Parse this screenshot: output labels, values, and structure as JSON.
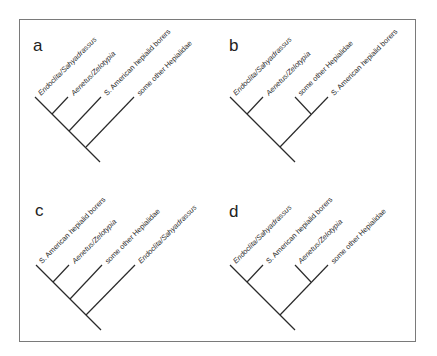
{
  "figure": {
    "type": "cladogram-comparison",
    "panels": [
      {
        "letter": "a",
        "taxa": [
          {
            "label": "Endoclita/Sahyadrassus",
            "italic": true
          },
          {
            "label": "Aenetus/Zelotypia",
            "italic": true
          },
          {
            "label": "S. American hepialid borers",
            "italic": false
          },
          {
            "label": "some other Hepialidae",
            "italic": false
          }
        ],
        "topology": "(((Endoclita/Sahyadrassus, Aenetus/Zelotypia), S. American hepialid borers), some other Hepialidae)"
      },
      {
        "letter": "b",
        "taxa": [
          {
            "label": "Endoclita/Sahyadrassus",
            "italic": true
          },
          {
            "label": "Aenetus/Zelotypia",
            "italic": true
          },
          {
            "label": "some other Hepialidae",
            "italic": false
          },
          {
            "label": "S. American hepialid borers",
            "italic": false
          }
        ],
        "topology": "((Endoclita/Sahyadrassus, Aenetus/Zelotypia), (some other Hepialidae, S. American hepialid borers))"
      },
      {
        "letter": "c",
        "taxa": [
          {
            "label": "S. American hepialid borers",
            "italic": false
          },
          {
            "label": "Aenetus/Zelotypia",
            "italic": true
          },
          {
            "label": "some other Hepialidae",
            "italic": false
          },
          {
            "label": "Endoclita/Sahyadrassus",
            "italic": true
          }
        ],
        "topology": "(((S. American hepialid borers, Aenetus/Zelotypia), some other Hepialidae), Endoclita/Sahyadrassus)"
      },
      {
        "letter": "d",
        "taxa": [
          {
            "label": "Endoclita/Sahyadrassus",
            "italic": true
          },
          {
            "label": "S. American hepialid borers",
            "italic": false
          },
          {
            "label": "Aenetus/Zelotypia",
            "italic": true
          },
          {
            "label": "some other Hepialidae",
            "italic": false
          }
        ],
        "topology": "((Endoclita/Sahyadrassus, S. American hepialid borers), (Aenetus/Zelotypia, some other Hepialidae))"
      }
    ]
  },
  "colors": {
    "line": "#2a2a2a",
    "frame": "#7a7a7a",
    "background": "#ffffff"
  }
}
